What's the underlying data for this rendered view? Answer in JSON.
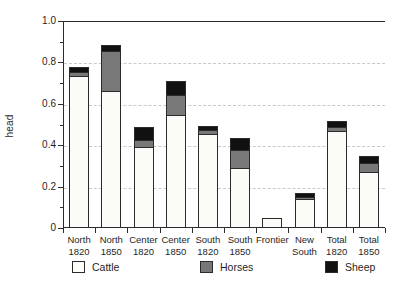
{
  "chart_data": {
    "type": "bar",
    "stacked": true,
    "title": "",
    "subtitle": "",
    "xlabel": "",
    "ylabel": "head",
    "ylim": [
      0,
      1.0
    ],
    "ytick_labels": [
      "0",
      "0.2",
      "0.4",
      "0.6",
      "0.8",
      "1.0"
    ],
    "ytick_values": [
      0,
      0.2,
      0.4,
      0.6,
      0.8,
      1.0
    ],
    "yminor_values": [
      0.1,
      0.3,
      0.5,
      0.7,
      0.9
    ],
    "grid": "horizontal-dashed",
    "legend_position": "bottom",
    "categories": [
      "North 1820",
      "North 1850",
      "Center 1820",
      "Center 1850",
      "South 1820",
      "South 1850",
      "Frontier",
      "New South",
      "Total 1820",
      "Total 1850"
    ],
    "category_lines": [
      [
        "North",
        "1820"
      ],
      [
        "North",
        "1850"
      ],
      [
        "Center",
        "1820"
      ],
      [
        "Center",
        "1850"
      ],
      [
        "South",
        "1820"
      ],
      [
        "South",
        "1850"
      ],
      [
        "Frontier",
        ""
      ],
      [
        "New",
        "South"
      ],
      [
        "Total",
        "1820"
      ],
      [
        "Total",
        "1850"
      ]
    ],
    "series": [
      {
        "name": "Cattle",
        "color": "#fbfbf7",
        "values": [
          0.735,
          0.66,
          0.39,
          0.545,
          0.455,
          0.29,
          0.05,
          0.14,
          0.47,
          0.27
        ]
      },
      {
        "name": "Horses",
        "color": "#787878",
        "values": [
          0.02,
          0.195,
          0.035,
          0.1,
          0.02,
          0.085,
          0.0,
          0.012,
          0.018,
          0.045
        ]
      },
      {
        "name": "Sheep",
        "color": "#111111",
        "values": [
          0.025,
          0.03,
          0.065,
          0.065,
          0.02,
          0.06,
          0.0,
          0.018,
          0.027,
          0.035
        ]
      }
    ],
    "totals": [
      0.78,
      0.885,
      0.49,
      0.71,
      0.495,
      0.435,
      0.05,
      0.17,
      0.515,
      0.35
    ]
  },
  "legend": {
    "items": [
      {
        "label": "Cattle",
        "swatch": "legend-swatch-cattle"
      },
      {
        "label": "Horses",
        "swatch": "legend-swatch-horses"
      },
      {
        "label": "Sheep",
        "swatch": "legend-swatch-sheep"
      }
    ]
  },
  "colors": {
    "cattle": "#fbfbf7",
    "horses": "#787878",
    "sheep": "#111111",
    "axis": "#2b2b2b",
    "grid": "#c9c9c9",
    "background": "#ffffff"
  }
}
